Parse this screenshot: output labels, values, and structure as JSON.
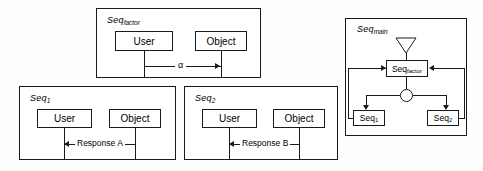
{
  "figure": {
    "background_color": "#fefefe",
    "line_color": "#1a1a1a"
  },
  "panels": {
    "factor": {
      "label_base": "Seq",
      "label_sub": "factor",
      "actors": [
        {
          "name": "User"
        },
        {
          "name": "Object"
        }
      ],
      "message": {
        "label": "α",
        "direction": "right"
      }
    },
    "seq1": {
      "label_base": "Seq",
      "label_sub": "1",
      "actors": [
        {
          "name": "User"
        },
        {
          "name": "Object"
        }
      ],
      "message": {
        "label": "Response A",
        "direction": "left"
      }
    },
    "seq2": {
      "label_base": "Seq",
      "label_sub": "2",
      "actors": [
        {
          "name": "User"
        },
        {
          "name": "Object"
        }
      ],
      "message": {
        "label": "Response B",
        "direction": "left"
      }
    },
    "main": {
      "label_base": "Seq",
      "label_sub": "main",
      "nodes": {
        "start": "start-triangle",
        "factor_base": "Seq",
        "factor_sub": "factor",
        "junction": "junction-circle",
        "branch1_base": "Seq",
        "branch1_sub": "1",
        "branch2_base": "Seq",
        "branch2_sub": "2"
      }
    }
  }
}
